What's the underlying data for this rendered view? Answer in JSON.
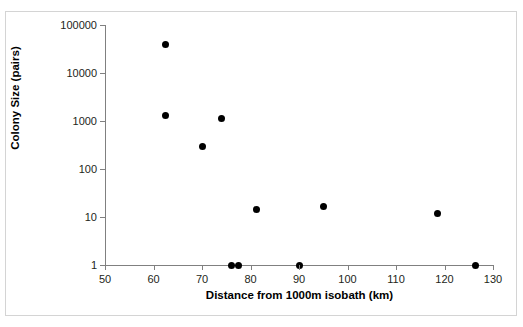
{
  "clipped_top_text": "",
  "chart_data": {
    "type": "scatter",
    "title": "",
    "xlabel": "Distance from 1000m isobath (km)",
    "ylabel": "Colony Size (pairs)",
    "xlim": [
      50,
      130
    ],
    "ylim": [
      1,
      100000
    ],
    "yscale": "log",
    "xscale": "linear",
    "xticks": [
      50,
      60,
      70,
      80,
      90,
      100,
      110,
      120,
      130
    ],
    "xtick_labels": [
      "50",
      "60",
      "70",
      "80",
      "90",
      "100",
      "110",
      "120",
      "130"
    ],
    "yticks": [
      1,
      10,
      100,
      1000,
      10000,
      100000
    ],
    "ytick_labels": [
      "1",
      "10",
      "100",
      "1000",
      "10000",
      "100000"
    ],
    "grid": false,
    "legend": false,
    "marker": "circle",
    "marker_color": "#000000",
    "series": [
      {
        "name": "Colony",
        "points": [
          {
            "x": 62.5,
            "y": 40000
          },
          {
            "x": 62.5,
            "y": 1300
          },
          {
            "x": 74.0,
            "y": 1150
          },
          {
            "x": 70.2,
            "y": 290
          },
          {
            "x": 81.3,
            "y": 14
          },
          {
            "x": 95.0,
            "y": 16.5
          },
          {
            "x": 118.5,
            "y": 12
          },
          {
            "x": 76.1,
            "y": 1
          },
          {
            "x": 77.6,
            "y": 1
          },
          {
            "x": 90.2,
            "y": 1
          },
          {
            "x": 126.3,
            "y": 1
          }
        ]
      }
    ]
  },
  "colors": {
    "axis": "#808080",
    "frame": "#d4d4d4",
    "text": "#231f20",
    "marker": "#000000",
    "background": "#ffffff"
  }
}
